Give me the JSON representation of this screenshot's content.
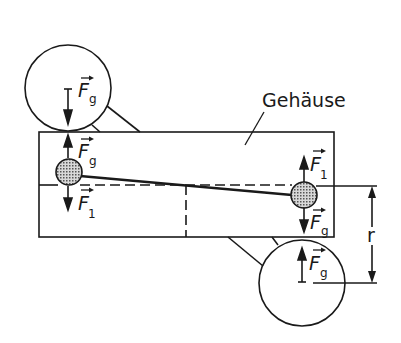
{
  "diagram": {
    "type": "mechanical-force-diagram",
    "housing_label": "Gehäuse",
    "dimension_label": "r",
    "colors": {
      "stroke": "#1a1a1a",
      "background": "#ffffff",
      "ball_fill": "#a8a8a8"
    },
    "forces": {
      "top_circle": {
        "symbol": "F",
        "subscript": "g",
        "direction": "down"
      },
      "left_ball_up": {
        "symbol": "F",
        "subscript": "g",
        "direction": "up"
      },
      "left_ball_down": {
        "symbol": "F",
        "subscript": "1",
        "direction": "down"
      },
      "right_ball_up": {
        "symbol": "F",
        "subscript": "1",
        "direction": "up"
      },
      "right_ball_down": {
        "symbol": "F",
        "subscript": "g",
        "direction": "down"
      },
      "bottom_circle": {
        "symbol": "F",
        "subscript": "g",
        "direction": "up"
      }
    }
  }
}
